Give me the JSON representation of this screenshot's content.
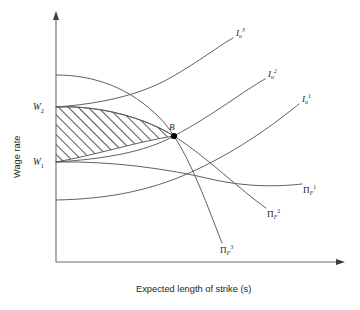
{
  "figure": {
    "type": "economics-diagram",
    "background_color": "#ffffff",
    "line_color": "#58595b",
    "axis_color": "#6d6e71",
    "text_color": "#231f20",
    "hatch_color": "#58595b"
  },
  "axes": {
    "y_title": "Wage rate",
    "x_title": "Expected length of strike (s)",
    "y_ticks": [
      {
        "label": "W",
        "subscript": "2",
        "y_px": 107
      },
      {
        "label": "W",
        "subscript": "1",
        "y_px": 162
      }
    ],
    "x_arrow": true,
    "y_arrow": true,
    "grid": false
  },
  "curves": [
    {
      "name": "union-indifference-3",
      "family": "union",
      "symbol": "I",
      "subscript": "u",
      "superscript": "3",
      "label_x": 236,
      "label_y": 34
    },
    {
      "name": "union-indifference-2",
      "family": "union",
      "symbol": "I",
      "subscript": "u",
      "superscript": "2",
      "label_x": 268,
      "label_y": 75
    },
    {
      "name": "union-indifference-1",
      "family": "union",
      "symbol": "I",
      "subscript": "u",
      "superscript": "1",
      "label_x": 302,
      "label_y": 100
    },
    {
      "name": "firm-isoprofit-1",
      "family": "firm",
      "symbol": "Π",
      "subscript": "F",
      "superscript": "1",
      "label_x": 305,
      "label_y": 191
    },
    {
      "name": "firm-isoprofit-2",
      "family": "firm",
      "symbol": "Π",
      "subscript": "F",
      "superscript": "2",
      "label_x": 269,
      "label_y": 215
    },
    {
      "name": "firm-isoprofit-3",
      "family": "firm",
      "symbol": "Π",
      "subscript": "F",
      "superscript": "3",
      "label_x": 222,
      "label_y": 251
    }
  ],
  "points": [
    {
      "name": "settlement-point-b",
      "label": "B",
      "x_px": 174,
      "y_px": 136,
      "label_x": 171,
      "label_y": 127
    }
  ],
  "regions": [
    {
      "name": "bargaining-lens",
      "fill": "diagonal-hatch",
      "bounded_by": [
        "W1",
        "W2",
        "union-indifference",
        "firm-isoprofit"
      ]
    }
  ]
}
